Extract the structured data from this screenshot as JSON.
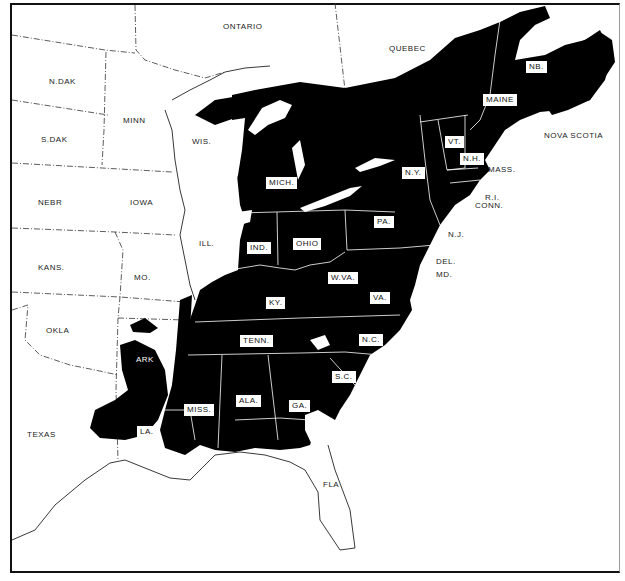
{
  "map": {
    "title": "",
    "colors": {
      "range_fill": "#000000",
      "background": "#ffffff",
      "border_line": "#ffffff",
      "outline": "#222222"
    },
    "legend": [],
    "outside_labels": [
      {
        "id": "ontario",
        "text": "ONTARIO",
        "x": 223,
        "y": 23
      },
      {
        "id": "quebec",
        "text": "QUEBEC",
        "x": 389,
        "y": 45
      },
      {
        "id": "nova-scotia",
        "text": "NOVA SCOTIA",
        "x": 544,
        "y": 132
      },
      {
        "id": "n-dak",
        "text": "N.DAK",
        "x": 49,
        "y": 78
      },
      {
        "id": "minn",
        "text": "MINN",
        "x": 123,
        "y": 117
      },
      {
        "id": "s-dak",
        "text": "S.DAK",
        "x": 41,
        "y": 136
      },
      {
        "id": "wis",
        "text": "WIS.",
        "x": 192,
        "y": 138
      },
      {
        "id": "nebr",
        "text": "NEBR",
        "x": 38,
        "y": 199
      },
      {
        "id": "iowa",
        "text": "IOWA",
        "x": 130,
        "y": 199
      },
      {
        "id": "ill",
        "text": "ILL.",
        "x": 199,
        "y": 240
      },
      {
        "id": "kans",
        "text": "KANS.",
        "x": 38,
        "y": 264
      },
      {
        "id": "mo",
        "text": "MO.",
        "x": 134,
        "y": 274
      },
      {
        "id": "okla",
        "text": "OKLA",
        "x": 46,
        "y": 327
      },
      {
        "id": "ark",
        "text": "ARK",
        "x": 136,
        "y": 356
      },
      {
        "id": "texas",
        "text": "TEXAS",
        "x": 27,
        "y": 431
      },
      {
        "id": "fla",
        "text": "FLA",
        "x": 323,
        "y": 481
      },
      {
        "id": "mass",
        "text": "MASS.",
        "x": 488,
        "y": 166
      },
      {
        "id": "ri",
        "text": "R.I.",
        "x": 485,
        "y": 194
      },
      {
        "id": "conn",
        "text": "CONN.",
        "x": 475,
        "y": 202
      },
      {
        "id": "nj",
        "text": "N.J.",
        "x": 448,
        "y": 231
      },
      {
        "id": "del",
        "text": "DEL.",
        "x": 436,
        "y": 258
      },
      {
        "id": "md",
        "text": "MD.",
        "x": 436,
        "y": 271
      }
    ],
    "boxed_labels": [
      {
        "id": "nb",
        "text": "NB.",
        "x": 526,
        "y": 61
      },
      {
        "id": "maine",
        "text": "MAINE",
        "x": 483,
        "y": 94
      },
      {
        "id": "vt",
        "text": "VT.",
        "x": 445,
        "y": 136
      },
      {
        "id": "nh",
        "text": "N.H.",
        "x": 460,
        "y": 153
      },
      {
        "id": "ny",
        "text": "N.Y.",
        "x": 402,
        "y": 167
      },
      {
        "id": "mich",
        "text": "MICH.",
        "x": 266,
        "y": 177
      },
      {
        "id": "pa",
        "text": "PA.",
        "x": 374,
        "y": 216
      },
      {
        "id": "ind",
        "text": "IND.",
        "x": 247,
        "y": 242
      },
      {
        "id": "ohio",
        "text": "OHIO",
        "x": 293,
        "y": 238
      },
      {
        "id": "wva",
        "text": "W.VA.",
        "x": 328,
        "y": 272
      },
      {
        "id": "va",
        "text": "VA.",
        "x": 370,
        "y": 292
      },
      {
        "id": "ky",
        "text": "KY.",
        "x": 266,
        "y": 297
      },
      {
        "id": "tenn",
        "text": "TENN.",
        "x": 240,
        "y": 335
      },
      {
        "id": "nc",
        "text": "N.C.",
        "x": 359,
        "y": 334
      },
      {
        "id": "sc",
        "text": "S.C.",
        "x": 332,
        "y": 371
      },
      {
        "id": "miss",
        "text": "MISS.",
        "x": 184,
        "y": 404
      },
      {
        "id": "ala",
        "text": "ALA.",
        "x": 236,
        "y": 395
      },
      {
        "id": "ga",
        "text": "GA.",
        "x": 289,
        "y": 400
      },
      {
        "id": "la",
        "text": "LA.",
        "x": 137,
        "y": 426
      }
    ]
  }
}
